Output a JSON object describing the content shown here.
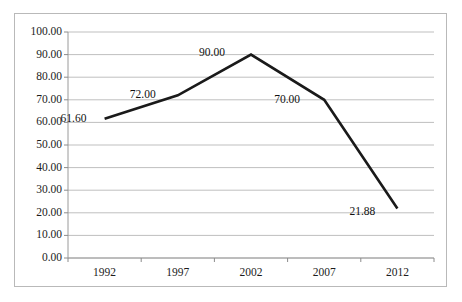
{
  "chart_data": {
    "type": "line",
    "title": "",
    "xlabel": "",
    "ylabel": "",
    "categories": [
      "1992",
      "1997",
      "2002",
      "2007",
      "2012"
    ],
    "values": [
      61.6,
      72.0,
      90.0,
      70.0,
      21.88
    ],
    "point_labels": [
      "61.60",
      "72.00",
      "90.00",
      "70.00",
      "21.88"
    ],
    "ylim": [
      0,
      100
    ],
    "ytick_labels": [
      "100.00",
      "90.00",
      "80.00",
      "70.00",
      "60.00",
      "50.00",
      "40.00",
      "30.00",
      "20.00",
      "10.00",
      "0.00"
    ],
    "ytick_values": [
      100,
      90,
      80,
      70,
      60,
      50,
      40,
      30,
      20,
      10,
      0
    ],
    "xtick_labels": [
      "1992",
      "1997",
      "2002",
      "2007",
      "2012"
    ],
    "grid": "horizontal",
    "legend": "none",
    "series": [
      {
        "name": "",
        "values": [
          61.6,
          72.0,
          90.0,
          70.0,
          21.88
        ]
      }
    ],
    "colors": {
      "line": "#1a1a1a",
      "grid": "#bfbfbf",
      "axis": "#8c8c8c",
      "border": "#b9b9b9",
      "background": "#ffffff",
      "text": "#1c1c1c"
    }
  }
}
